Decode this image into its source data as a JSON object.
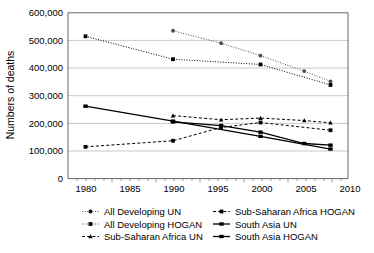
{
  "chart_data": {
    "type": "line",
    "title": "",
    "xlabel": "",
    "ylabel": "Numbers of deaths",
    "xlim": [
      1978,
      2010
    ],
    "ylim": [
      0,
      600000
    ],
    "xticks": [
      1980,
      1985,
      1990,
      1995,
      2000,
      2005,
      2010
    ],
    "yticks": [
      0,
      100000,
      200000,
      300000,
      400000,
      500000,
      600000
    ],
    "ytick_labels": [
      "0",
      "100,000",
      "200,000",
      "300,000",
      "400,000",
      "500,000",
      "600,000"
    ],
    "xtick_labels": [
      "1980",
      "1985",
      "1990",
      "1995",
      "2000",
      "2005",
      "2010"
    ],
    "grid": "horizontal",
    "legend_position": "bottom",
    "series": [
      {
        "name": "All Developing UN",
        "marker": "circle",
        "line": "dotted",
        "color": "#4d4d4d",
        "x": [
          1990,
          1995.5,
          2000,
          2005,
          2008
        ],
        "values": [
          535000,
          490000,
          445000,
          389000,
          352000
        ]
      },
      {
        "name": "All Developing HOGAN",
        "marker": "square",
        "line": "dotted",
        "color": "#000000",
        "x": [
          1980,
          1990,
          2000,
          2008
        ],
        "values": [
          515000,
          432000,
          413000,
          339000
        ]
      },
      {
        "name": "Sub-Saharan Africa UN",
        "marker": "triangle",
        "line": "dashed",
        "color": "#000000",
        "x": [
          1990,
          1995.5,
          2000,
          2005,
          2008
        ],
        "values": [
          228000,
          213000,
          219000,
          210000,
          202000
        ]
      },
      {
        "name": "Sub-Saharan Africa HOGAN",
        "marker": "square",
        "line": "dashed",
        "color": "#000000",
        "x": [
          1980,
          1990,
          1995.5,
          2000,
          2008
        ],
        "values": [
          115000,
          137000,
          185000,
          203000,
          175000
        ]
      },
      {
        "name": "South Asia UN",
        "marker": "dash",
        "line": "solid",
        "color": "#000000",
        "x": [
          1980,
          1990,
          2000,
          2008
        ],
        "values": [
          262000,
          208000,
          153000,
          107000
        ]
      },
      {
        "name": "South Asia HOGAN",
        "marker": "dash",
        "line": "solid",
        "color": "#000000",
        "x": [
          1990,
          1995.5,
          2000,
          2005,
          2008
        ],
        "values": [
          205000,
          192000,
          168000,
          127000,
          121000
        ]
      }
    ]
  },
  "legend": {
    "entries": [
      {
        "label": "All Developing UN"
      },
      {
        "label": "Sub-Saharan Africa HOGAN"
      },
      {
        "label": "All Developing HOGAN"
      },
      {
        "label": "South Asia UN"
      },
      {
        "label": "Sub-Saharan Africa UN"
      },
      {
        "label": "South Asia HOGAN"
      }
    ]
  }
}
